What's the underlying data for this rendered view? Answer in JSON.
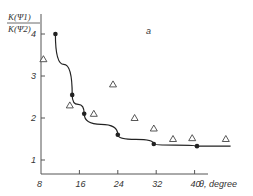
{
  "chart_data": {
    "type": "scatter",
    "title": "",
    "panel_label": "a",
    "xlabel": "θ, degree",
    "ylabel_numerator": "K(Ψ1)",
    "ylabel_denominator": "K(Ψ2)",
    "xlim": [
      7.5,
      46
    ],
    "ylim": [
      0.7,
      4.4
    ],
    "x_ticks": [
      8,
      16,
      24,
      32,
      40
    ],
    "y_ticks": [
      1,
      2,
      3,
      4
    ],
    "grid": false,
    "series": [
      {
        "name": "filled circles (fit curve)",
        "marker": "circle-filled",
        "line": true,
        "points": [
          [
            11,
            4.0
          ],
          [
            14.5,
            2.55
          ],
          [
            17,
            2.1
          ],
          [
            24,
            1.6
          ],
          [
            31.5,
            1.38
          ],
          [
            40.5,
            1.33
          ],
          [
            47.5,
            1.33
          ]
        ]
      },
      {
        "name": "open triangles",
        "marker": "triangle-open",
        "line": false,
        "points": [
          [
            8.5,
            3.4
          ],
          [
            14,
            2.3
          ],
          [
            19,
            2.1
          ],
          [
            23,
            2.8
          ],
          [
            27.5,
            2.0
          ],
          [
            31.5,
            1.75
          ],
          [
            35.5,
            1.5
          ],
          [
            39.5,
            1.52
          ],
          [
            46.5,
            1.5
          ]
        ]
      }
    ]
  }
}
